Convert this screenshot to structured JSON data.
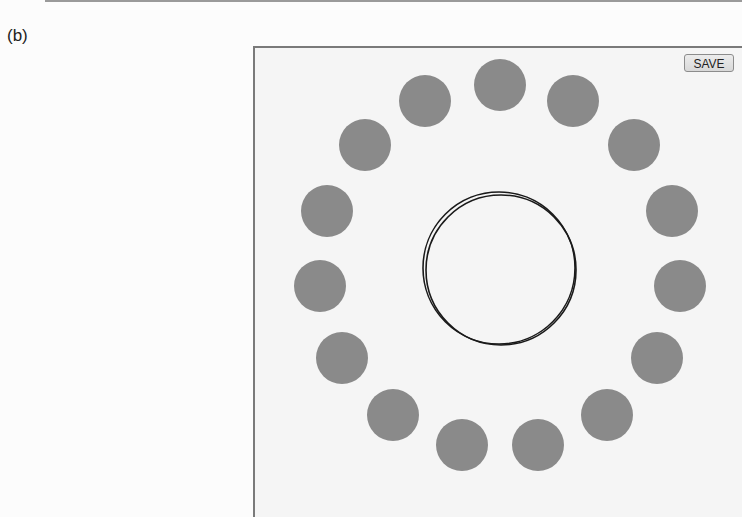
{
  "panel": {
    "label": "(b)"
  },
  "toolbar": {
    "save_label": "SAVE"
  },
  "colors": {
    "canvas_bg": "#f5f5f5",
    "dot_fill": "#8a8a8a",
    "ring_stroke": "#1a1a1a"
  },
  "dots": {
    "radius": 26,
    "items": [
      {
        "cx": 500,
        "cy": 85
      },
      {
        "cx": 573,
        "cy": 101
      },
      {
        "cx": 634,
        "cy": 145
      },
      {
        "cx": 672,
        "cy": 211
      },
      {
        "cx": 680,
        "cy": 286
      },
      {
        "cx": 657,
        "cy": 358
      },
      {
        "cx": 607,
        "cy": 415
      },
      {
        "cx": 538,
        "cy": 445
      },
      {
        "cx": 462,
        "cy": 445
      },
      {
        "cx": 393,
        "cy": 415
      },
      {
        "cx": 342,
        "cy": 358
      },
      {
        "cx": 320,
        "cy": 286
      },
      {
        "cx": 327,
        "cy": 211
      },
      {
        "cx": 365,
        "cy": 145
      },
      {
        "cx": 425,
        "cy": 101
      }
    ]
  },
  "center_rings": [
    {
      "cx": 499,
      "cy": 268,
      "r": 76
    },
    {
      "cx": 501,
      "cy": 270,
      "r": 75
    }
  ]
}
